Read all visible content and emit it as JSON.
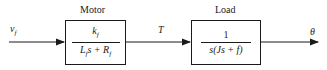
{
  "diagram": {
    "input_signal": "v_f",
    "input_label": "vf",
    "intermediate_signal": "T",
    "output_signal": "θ",
    "blocks": [
      {
        "title": "Motor",
        "numerator": "k_f",
        "numerator_display": "kf",
        "denominator": "L_f s + R_f",
        "denominator_display": "Lfs + Rf"
      },
      {
        "title": "Load",
        "numerator": "1",
        "denominator": "s(Js + f)"
      }
    ],
    "colors": {
      "line": "#1a1a1a",
      "background": "#ffffff"
    }
  }
}
